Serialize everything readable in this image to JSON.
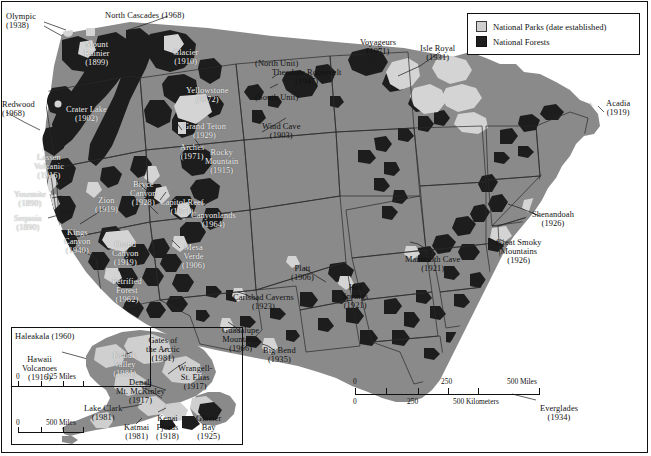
{
  "figure": {
    "background_color": "#ffffff",
    "land_color": "#8a8a8a",
    "park_color": "#cfcfcf",
    "forest_color": "#1d1d1d",
    "border_color": "#111111"
  },
  "legend": {
    "items": [
      {
        "swatch": "parks-swatch",
        "label": "National Parks (date established)"
      },
      {
        "swatch": "forests-swatch",
        "label": "National Forests"
      }
    ]
  },
  "scales": {
    "main": {
      "miles": {
        "ticks": [
          "0",
          "250",
          "500 Miles"
        ]
      },
      "kilometers": {
        "ticks": [
          "0",
          "250",
          "500 Kilometers"
        ]
      }
    },
    "hawaii_inset": {
      "ticks": [
        "0",
        "125 Miles"
      ]
    },
    "alaska_inset": {
      "ticks": [
        "0",
        "500 Miles"
      ]
    }
  },
  "park_labels": [
    {
      "name": "Olympic",
      "year": "(1938)",
      "x": 6,
      "y": 12,
      "style": "dark",
      "align": "left"
    },
    {
      "name": "North Cascades (1968)",
      "year": "",
      "x": 105,
      "y": 11,
      "style": "dark",
      "align": "left"
    },
    {
      "name": "Mount\nRainier",
      "year": "(1899)",
      "x": 84,
      "y": 40,
      "style": "onmap",
      "align": "center"
    },
    {
      "name": "Glacier",
      "year": "(1910)",
      "x": 173,
      "y": 48,
      "style": "onmap",
      "align": "center"
    },
    {
      "name": "Yellowstone",
      "year": "(1872)",
      "x": 186,
      "y": 86,
      "style": "onmap",
      "align": "center"
    },
    {
      "name": "Redwood",
      "year": "(1968)",
      "x": 2,
      "y": 100,
      "style": "dark",
      "align": "left"
    },
    {
      "name": "Crater Lake",
      "year": "(1902)",
      "x": 66,
      "y": 105,
      "style": "onmap",
      "align": "center"
    },
    {
      "name": "Grand Teton",
      "year": "(1929)",
      "x": 183,
      "y": 122,
      "style": "onmap",
      "align": "center"
    },
    {
      "name": "Wind Cave",
      "year": "(1903)",
      "x": 262,
      "y": 122,
      "style": "dark",
      "align": "center"
    },
    {
      "name": "Lassen\nVolcanic",
      "year": "(1916)",
      "x": 34,
      "y": 153,
      "style": "onmap",
      "align": "center"
    },
    {
      "name": "Arches",
      "year": "(1971)",
      "x": 180,
      "y": 143,
      "style": "onmap",
      "align": "center"
    },
    {
      "name": "Rocky\nMountain",
      "year": "(1915)",
      "x": 205,
      "y": 148,
      "style": "onmap",
      "align": "center"
    },
    {
      "name": "Yosemite",
      "year": "(1890)",
      "x": 14,
      "y": 190,
      "style": "onmap",
      "align": "center"
    },
    {
      "name": "Zion",
      "year": "(1919)",
      "x": 95,
      "y": 196,
      "style": "onmap",
      "align": "center"
    },
    {
      "name": "Bryce\nCanyon",
      "year": "(1928)",
      "x": 130,
      "y": 180,
      "style": "onmap",
      "align": "center"
    },
    {
      "name": "Capitol Reef",
      "year": "(1971)",
      "x": 160,
      "y": 198,
      "style": "onmap",
      "align": "center"
    },
    {
      "name": "Canyonlands",
      "year": "(1964)",
      "x": 191,
      "y": 211,
      "style": "onmap",
      "align": "center"
    },
    {
      "name": "Sequoia",
      "year": "(1890)",
      "x": 14,
      "y": 214,
      "style": "onmap",
      "align": "center"
    },
    {
      "name": "Kings\nCanyon",
      "year": "(1940)",
      "x": 64,
      "y": 228,
      "style": "onmap",
      "align": "center"
    },
    {
      "name": "Grand\nCanyon",
      "year": "(1919)",
      "x": 112,
      "y": 240,
      "style": "onmap",
      "align": "center"
    },
    {
      "name": "Mesa\nVerde",
      "year": "(1906)",
      "x": 182,
      "y": 243,
      "style": "onmap",
      "align": "center"
    },
    {
      "name": "Petrified\nForest",
      "year": "(1962)",
      "x": 112,
      "y": 277,
      "style": "onmap",
      "align": "center"
    },
    {
      "name": "Theodore Roosevelt",
      "year": "(1947)",
      "x": 272,
      "y": 68,
      "style": "dark",
      "align": "center"
    },
    {
      "name": "(North Unit)",
      "year": "",
      "x": 255,
      "y": 59,
      "style": "dark",
      "align": "left"
    },
    {
      "name": "(South Unit)",
      "year": "",
      "x": 255,
      "y": 93,
      "style": "dark",
      "align": "left"
    },
    {
      "name": "Voyageurs",
      "year": "(1971)",
      "x": 360,
      "y": 38,
      "style": "dark",
      "align": "center"
    },
    {
      "name": "Isle Royal",
      "year": "(1931)",
      "x": 420,
      "y": 44,
      "style": "dark",
      "align": "center"
    },
    {
      "name": "Acadia",
      "year": "(1919)",
      "x": 606,
      "y": 99,
      "style": "dark",
      "align": "center"
    },
    {
      "name": "Shenandoah",
      "year": "(1926)",
      "x": 532,
      "y": 210,
      "style": "dark",
      "align": "center"
    },
    {
      "name": "Great Smoky\nMountains",
      "year": "(1926)",
      "x": 496,
      "y": 238,
      "style": "dark",
      "align": "center"
    },
    {
      "name": "Mammoth Cave",
      "year": "(1921)",
      "x": 405,
      "y": 255,
      "style": "dark",
      "align": "center"
    },
    {
      "name": "Platt",
      "year": "(1906)",
      "x": 291,
      "y": 264,
      "style": "dark",
      "align": "center"
    },
    {
      "name": "Hot\nSprings",
      "year": "(1921)",
      "x": 342,
      "y": 283,
      "style": "dark",
      "align": "center"
    },
    {
      "name": "Carlsbad Caverns",
      "year": "(1923)",
      "x": 233,
      "y": 293,
      "style": "dark",
      "align": "center"
    },
    {
      "name": "Guadalupe\nMountains",
      "year": "(1966)",
      "x": 222,
      "y": 326,
      "style": "dark",
      "align": "center"
    },
    {
      "name": "Big Bend",
      "year": "(1935)",
      "x": 263,
      "y": 346,
      "style": "dark",
      "align": "center"
    },
    {
      "name": "Everglades",
      "year": "(1934)",
      "x": 540,
      "y": 404,
      "style": "dark",
      "align": "center"
    }
  ],
  "inset_labels": [
    {
      "name": "Haleakala (1960)",
      "year": "",
      "x": 15,
      "y": 332,
      "style": "dark",
      "align": "left"
    },
    {
      "name": "Hawaii\nVolcanoes",
      "year": "(1916)",
      "x": 22,
      "y": 355,
      "style": "dark",
      "align": "center"
    },
    {
      "name": "Gates of\nthe Arctic",
      "year": "(1981)",
      "x": 146,
      "y": 336,
      "style": "dark",
      "align": "center"
    },
    {
      "name": "Kobuk\nValley",
      "year": "(1981)",
      "x": 113,
      "y": 351,
      "style": "onmap",
      "align": "center"
    },
    {
      "name": "Wrangell-\nSt. Elias",
      "year": "(1917)",
      "x": 178,
      "y": 364,
      "style": "dark",
      "align": "center"
    },
    {
      "name": "Denali\nMt. McKinley",
      "year": "(1917)",
      "x": 116,
      "y": 378,
      "style": "dark",
      "align": "center"
    },
    {
      "name": "Lake Clark",
      "year": "(1981)",
      "x": 84,
      "y": 404,
      "style": "dark",
      "align": "center"
    },
    {
      "name": "Katmai",
      "year": "(1981)",
      "x": 124,
      "y": 423,
      "style": "dark",
      "align": "center"
    },
    {
      "name": "Kenai\nFjords",
      "year": "(1918)",
      "x": 156,
      "y": 414,
      "style": "dark",
      "align": "center"
    },
    {
      "name": "Glacier\nBay",
      "year": "(1925)",
      "x": 196,
      "y": 414,
      "style": "dark",
      "align": "center"
    }
  ]
}
